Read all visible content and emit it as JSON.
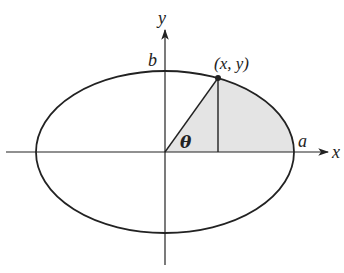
{
  "diagram": {
    "labels": {
      "x_axis": "x",
      "y_axis": "y",
      "semi_major": "a",
      "semi_minor": "b",
      "point": "(x, y)",
      "angle": "θ"
    },
    "colors": {
      "stroke": "#222222",
      "shaded_region": "#e4e4e4",
      "background": "#ffffff"
    },
    "geometry": {
      "origin_px": [
        165,
        152
      ],
      "a_px": 129,
      "b_px": 81,
      "point_px": [
        218,
        78
      ]
    }
  }
}
